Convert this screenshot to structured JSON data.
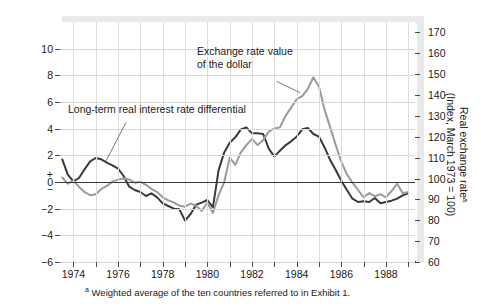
{
  "chart_data": {
    "type": "line",
    "title": "",
    "subtitle": "",
    "xlabel": "",
    "ylabel": "Real interest rate differential\n(percentage points)",
    "y2label": "Real exchange rateᵃ\n(Index, March 1973 = 100)",
    "grid": true,
    "legend_position": "inline-annotation",
    "xlim": [
      1973.4,
      1989.3
    ],
    "ylim": [
      -6,
      12
    ],
    "y2lim": [
      60,
      175
    ],
    "xticks": [
      1974,
      1975,
      1976,
      1977,
      1978,
      1979,
      1980,
      1981,
      1982,
      1983,
      1984,
      1985,
      1986,
      1987,
      1988,
      1989
    ],
    "xticklabels": [
      "1974",
      "",
      "1976",
      "",
      "1978",
      "",
      "1980",
      "",
      "1982",
      "",
      "1984",
      "",
      "1986",
      "",
      "1988",
      ""
    ],
    "yticks": [
      -6,
      -4,
      -2,
      0,
      2,
      4,
      6,
      8,
      10
    ],
    "yticklabels": [
      "−6",
      "−4",
      "−2",
      "0",
      "2",
      "4",
      "6",
      "8",
      "10"
    ],
    "y2ticks": [
      60,
      70,
      80,
      90,
      100,
      110,
      120,
      130,
      140,
      150,
      160,
      170
    ],
    "y2ticklabels": [
      "60",
      "70",
      "80",
      "90",
      "100",
      "110",
      "120",
      "130",
      "140",
      "150",
      "160",
      "170"
    ],
    "zero_marker": [
      "+",
      "0",
      "−"
    ],
    "series": [
      {
        "name": "Long-term real interest rate differential",
        "axis": "left",
        "color": "#3a3a3a",
        "width": 2.0,
        "x": [
          1973.5,
          1973.75,
          1974.0,
          1974.25,
          1974.5,
          1974.75,
          1975.0,
          1975.25,
          1975.5,
          1975.75,
          1976.0,
          1976.25,
          1976.5,
          1976.75,
          1977.0,
          1977.25,
          1977.5,
          1977.75,
          1978.0,
          1978.25,
          1978.5,
          1978.75,
          1979.0,
          1979.25,
          1979.5,
          1979.75,
          1980.0,
          1980.25,
          1980.5,
          1980.75,
          1981.0,
          1981.25,
          1981.5,
          1981.75,
          1982.0,
          1982.25,
          1982.5,
          1982.75,
          1983.0,
          1983.25,
          1983.5,
          1983.75,
          1984.0,
          1984.25,
          1984.5,
          1984.75,
          1985.0,
          1985.25,
          1985.5,
          1985.75,
          1986.0,
          1986.25,
          1986.5,
          1986.75,
          1987.0,
          1987.25,
          1987.5,
          1987.75,
          1988.0,
          1988.25,
          1988.5,
          1988.75,
          1989.0
        ],
        "y": [
          1.7,
          0.55,
          0.05,
          0.3,
          0.95,
          1.55,
          1.8,
          1.7,
          1.45,
          1.25,
          1.0,
          0.45,
          -0.35,
          -0.6,
          -0.75,
          -1.05,
          -0.85,
          -1.15,
          -1.6,
          -1.8,
          -2.0,
          -2.05,
          -2.9,
          -2.4,
          -1.7,
          -1.55,
          -1.35,
          -1.9,
          0.85,
          2.2,
          2.95,
          3.35,
          3.95,
          4.1,
          3.65,
          3.65,
          3.6,
          2.5,
          1.9,
          2.35,
          2.75,
          3.05,
          3.4,
          3.95,
          4.05,
          3.6,
          3.4,
          2.6,
          1.65,
          0.9,
          0.1,
          -0.6,
          -1.25,
          -1.5,
          -1.45,
          -1.5,
          -1.2,
          -1.6,
          -1.5,
          -1.4,
          -1.25,
          -1.0,
          -0.85
        ]
      },
      {
        "name": "Exchange rate value of the dollar",
        "axis": "right",
        "color": "#9a9a9a",
        "width": 2.0,
        "x": [
          1973.5,
          1973.75,
          1974.0,
          1974.25,
          1974.5,
          1974.75,
          1975.0,
          1975.25,
          1975.5,
          1975.75,
          1976.0,
          1976.25,
          1976.5,
          1976.75,
          1977.0,
          1977.25,
          1977.5,
          1977.75,
          1978.0,
          1978.25,
          1978.5,
          1978.75,
          1979.0,
          1979.25,
          1979.5,
          1979.75,
          1980.0,
          1980.25,
          1980.5,
          1980.75,
          1981.0,
          1981.25,
          1981.5,
          1981.75,
          1982.0,
          1982.25,
          1982.5,
          1982.75,
          1983.0,
          1983.25,
          1983.5,
          1983.75,
          1984.0,
          1984.25,
          1984.5,
          1984.75,
          1985.0,
          1985.25,
          1985.5,
          1985.75,
          1986.0,
          1986.25,
          1986.5,
          1986.75,
          1987.0,
          1987.25,
          1987.5,
          1987.75,
          1988.0,
          1988.25,
          1988.5,
          1988.75,
          1989.0
        ],
        "y": [
          100.5,
          97.5,
          99.0,
          96.0,
          93.5,
          92.0,
          92.5,
          95.0,
          96.5,
          98.5,
          99.5,
          100.0,
          99.5,
          98.0,
          98.5,
          97.0,
          95.0,
          93.5,
          91.0,
          89.5,
          88.5,
          87.0,
          86.5,
          88.0,
          87.0,
          84.5,
          88.5,
          83.5,
          92.0,
          98.0,
          110.0,
          106.5,
          112.5,
          116.0,
          119.0,
          116.0,
          118.5,
          122.5,
          124.0,
          124.5,
          130.0,
          134.0,
          138.0,
          139.5,
          143.0,
          148.5,
          144.0,
          133.0,
          124.5,
          116.0,
          108.0,
          102.0,
          98.0,
          94.5,
          91.0,
          93.0,
          91.5,
          92.5,
          91.0,
          94.0,
          97.5,
          93.0,
          93.5
        ]
      }
    ],
    "annotations": [
      {
        "text": "Exchange rate value\nof the dollar",
        "x": 1981.9,
        "y": 9.1,
        "leader_from": [
          1983.1,
          7.55
        ],
        "leader_to": [
          1984.15,
          6.7
        ]
      },
      {
        "text": "Long-term real interest rate differential",
        "x": 1974.55,
        "y": 5.45,
        "leader_from": [
          1976.35,
          4.45
        ],
        "leader_to": [
          1975.45,
          1.55
        ]
      }
    ],
    "footnote": "Weighted average of the ten countries referred to in Exhibit 1.",
    "footnote_marker": "a"
  },
  "figure": {
    "background": "#ffffff",
    "plot_background": "#ffffff",
    "gridline_color": "#d8d8d8",
    "axis_color": "#2a2a2a",
    "zero_line_color": "#3a3a3a",
    "band_color": "#e9e9e9"
  }
}
